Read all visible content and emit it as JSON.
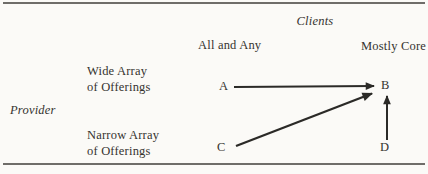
{
  "diagram": {
    "title_axis": {
      "clients": "Clients",
      "provider": "Provider"
    },
    "columns": [
      {
        "label": "All and Any"
      },
      {
        "label": "Mostly Core"
      }
    ],
    "rows": [
      {
        "line1": "Wide Array",
        "line2": "of Offerings"
      },
      {
        "line1": "Narrow Array",
        "line2": "of Offerings"
      }
    ],
    "nodes": [
      {
        "id": "A"
      },
      {
        "id": "B"
      },
      {
        "id": "C"
      },
      {
        "id": "D"
      }
    ],
    "edges": [
      {
        "from": "A",
        "to": "B",
        "direction": "horizontal-right"
      },
      {
        "from": "C",
        "to": "B",
        "direction": "diagonal-up-right"
      },
      {
        "from": "D",
        "to": "B",
        "direction": "vertical-up"
      }
    ],
    "colors": {
      "background": "#fbfaf7",
      "text": "#35332f",
      "arrow": "#2b2a27",
      "rule": "#6f6d69"
    }
  }
}
